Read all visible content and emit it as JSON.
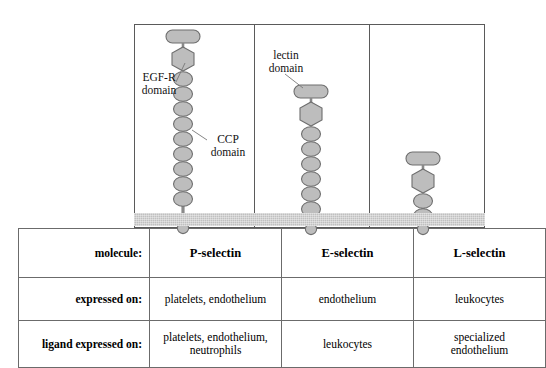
{
  "figure": {
    "colors": {
      "domain_fill": "#bdbdbd",
      "domain_stroke": "#6e6e6e",
      "membrane": "#c0c0c0",
      "frame": "#5a5a5a",
      "text": "#111111"
    }
  },
  "annotations": [
    {
      "id": "egf-r",
      "label": "EGF-R\ndomain",
      "line1": "EGF-R",
      "line2": "domain"
    },
    {
      "id": "ccp",
      "label": "CCP\ndomain",
      "line1": "CCP",
      "line2": "domain"
    },
    {
      "id": "lectin",
      "label": "lectin\ndomain",
      "line1": "lectin",
      "line2": "domain"
    }
  ],
  "molecules": [
    {
      "name": "P-selectin",
      "lectin_domains": 1,
      "egf_r_domains": 1,
      "ccp_domains": 9,
      "has_transmembrane": true,
      "has_cytoplasmic_tail": true
    },
    {
      "name": "E-selectin",
      "lectin_domains": 1,
      "egf_r_domains": 1,
      "ccp_domains": 6,
      "has_transmembrane": true,
      "has_cytoplasmic_tail": true
    },
    {
      "name": "L-selectin",
      "lectin_domains": 1,
      "egf_r_domains": 1,
      "ccp_domains": 2,
      "has_transmembrane": true,
      "has_cytoplasmic_tail": true
    }
  ],
  "table": {
    "row_labels": [
      "molecule:",
      "expressed on:",
      "ligand expressed on:"
    ],
    "columns": [
      "P-selectin",
      "E-selectin",
      "L-selectin"
    ],
    "rows": [
      {
        "label": "molecule:",
        "values": [
          "P-selectin",
          "E-selectin",
          "L-selectin"
        ]
      },
      {
        "label": "expressed on:",
        "values": [
          "platelets, endothelium",
          "endothelium",
          "leukocytes"
        ]
      },
      {
        "label": "ligand expressed on:",
        "values": [
          "platelets, endothelium,\nneutrophils",
          "leukocytes",
          "specialized\nendothelium"
        ],
        "values_line1": [
          "platelets, endothelium,",
          "leukocytes",
          "specialized"
        ],
        "values_line2": [
          "neutrophils",
          "",
          "endothelium"
        ]
      }
    ]
  }
}
